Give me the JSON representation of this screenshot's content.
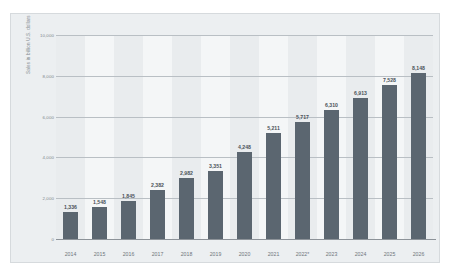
{
  "chart_data": {
    "type": "bar",
    "title": "",
    "subtitle": "",
    "xlabel": "",
    "ylabel": "Sales in billion U.S. dollars",
    "categories": [
      "2014",
      "2015",
      "2016",
      "2017",
      "2018",
      "2019",
      "2020",
      "2021",
      "2022*",
      "2023",
      "2024",
      "2025",
      "2026"
    ],
    "values": [
      1336,
      1548,
      1845,
      2382,
      2982,
      3351,
      4248,
      5211,
      5717,
      6310,
      6913,
      7528,
      8148
    ],
    "value_labels": [
      "1,336",
      "1,548",
      "1,845",
      "2,382",
      "2,982",
      "3,351",
      "4,248",
      "5,211",
      "5,717",
      "6,310",
      "6,913",
      "7,528",
      "8,148"
    ],
    "ylim": [
      0,
      10000
    ],
    "yticks": [
      0,
      2000,
      4000,
      6000,
      8000,
      10000
    ],
    "ytick_labels": [
      "0",
      "2,000",
      "4,000",
      "6,000",
      "8,000",
      "10,000"
    ],
    "grid": true,
    "grid_axis": "y",
    "legend": false,
    "legend_position": "none",
    "bar_color": "#5b6670",
    "plot_background": "#e9ecee",
    "band_color": "#f4f6f7",
    "frame_color": "#eceff1",
    "gridline_color": "#b9bfc4",
    "axis_text_color": "#80878d",
    "label_text_color": "#4a5259"
  }
}
